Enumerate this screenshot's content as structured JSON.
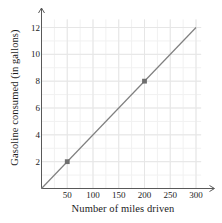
{
  "chart_data": {
    "type": "line",
    "title": "",
    "xlabel": "Number of miles driven",
    "ylabel": "Gasoline consumed (in gallons)",
    "xlim": [
      0,
      310
    ],
    "ylim": [
      0,
      12.6
    ],
    "xticks": [
      50,
      100,
      150,
      200,
      250,
      300
    ],
    "xtick_labels": [
      "50",
      "100",
      "150",
      "200",
      "250",
      "300"
    ],
    "yticks": [
      2,
      4,
      6,
      8,
      10,
      12
    ],
    "ytick_labels": [
      "2",
      "4",
      "6",
      "8",
      "10",
      "12"
    ],
    "grid": true,
    "minor_grid": true,
    "minor_grid_x_step": 25,
    "minor_grid_y_step": 1,
    "legend": "none",
    "series": [
      {
        "name": "gasoline consumed vs miles driven",
        "x": [
          0,
          300
        ],
        "y": [
          0,
          12
        ],
        "slope": 0.04,
        "intercept": 0,
        "color": "#808080",
        "marked_points": [
          {
            "x": 50,
            "y": 2
          },
          {
            "x": 200,
            "y": 8
          }
        ],
        "marker_color": "#6e6e6e"
      }
    ]
  },
  "colors": {
    "axis": "#595959",
    "line": "#808080",
    "marker": "#6e6e6e",
    "major_grid": "#e6e6e6",
    "minor_grid": "#f1f1f1",
    "text": "#1b1b1b",
    "background": "#ffffff"
  },
  "icons": {
    "x_axis_arrow": "arrow-right-icon",
    "y_axis_arrow": "arrow-up-icon"
  }
}
